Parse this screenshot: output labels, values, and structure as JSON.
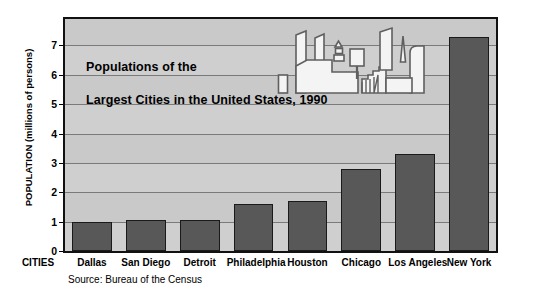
{
  "chart_data": {
    "type": "bar",
    "title": "Populations of the Largest Cities in the United States, 1990",
    "title_lines": [
      "Populations of the",
      "Largest Cities in the United States, 1990"
    ],
    "xlabel": "CITIES",
    "ylabel": "POPULATION (millions of persons)",
    "categories": [
      "Dallas",
      "San Diego",
      "Detroit",
      "Philadelphia",
      "Houston",
      "Chicago",
      "Los Angeles",
      "New York"
    ],
    "values": [
      1.0,
      1.05,
      1.05,
      1.6,
      1.7,
      2.8,
      3.3,
      7.3
    ],
    "ylim": [
      0,
      7.9
    ],
    "yticks": [
      0,
      1,
      2,
      3,
      4,
      5,
      6,
      7
    ],
    "ytick_labels": [
      "0",
      "1",
      "2",
      "3",
      "4",
      "5",
      "6",
      "7"
    ],
    "grid": true,
    "legend": null,
    "source": "Source: Bureau of the Census",
    "colors": {
      "bar_fill": "#585858",
      "bar_border": "#1a1a1a",
      "plot_background": "#c9c9c9",
      "gridline": "#7a7a7a",
      "frame": "#111111",
      "text": "#000000",
      "page_background": "#ffffff",
      "icon_fill": "#f2f2f2",
      "icon_stroke": "#555555"
    }
  },
  "icons": {
    "cityscape": "cityscape-icon"
  }
}
